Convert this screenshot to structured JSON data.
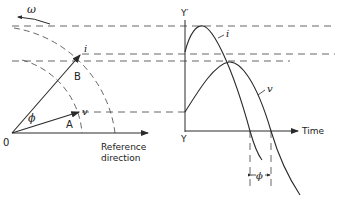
{
  "diagram": {
    "phasor": {
      "angular_velocity_label": "ω",
      "origin_label": "0",
      "phase_angle_label": "ϕ",
      "vector_a_label": "A",
      "vector_b_label": "B",
      "voltage_label": "v",
      "current_label": "i",
      "reference_label_line1": "Reference",
      "reference_label_line2": "direction"
    },
    "waveform": {
      "y_axis_top_label": "Y′",
      "y_axis_bottom_label": "Y",
      "time_axis_label": "Time",
      "current_curve_label": "i",
      "voltage_curve_label": "v",
      "phase_difference_label": "ϕ"
    },
    "colors": {
      "line": "#2a2a2a",
      "dashed": "#555555",
      "background": "#ffffff"
    }
  }
}
